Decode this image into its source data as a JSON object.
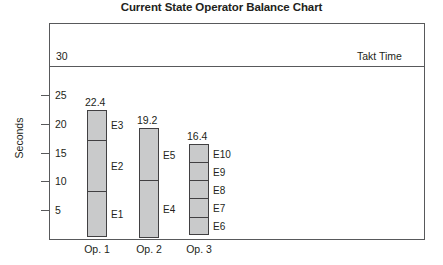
{
  "chart_data": {
    "type": "bar",
    "title": "Current State Operator Balance Chart",
    "xlabel": "",
    "ylabel": "Seconds",
    "ylim": [
      0,
      31
    ],
    "grid": false,
    "legend_position": "none",
    "categories": [
      "Op. 1",
      "Op. 2",
      "Op. 3"
    ],
    "values": [
      22.4,
      19.2,
      16.4
    ],
    "value_labels": [
      "22.4",
      "19.2",
      "16.4"
    ],
    "y_ticks": [
      5,
      10,
      15,
      20,
      25
    ],
    "y_tick_labels": [
      "5",
      "10",
      "15",
      "20",
      "25"
    ],
    "reference_line": {
      "label": "Takt Time",
      "value": 30,
      "value_label": "30"
    },
    "stacked_segments": [
      {
        "category": "Op. 1",
        "total": 22.4,
        "segments": [
          {
            "label": "E3",
            "value": 5.4
          },
          {
            "label": "E2",
            "value": 9.0
          },
          {
            "label": "E1",
            "value": 8.0
          }
        ]
      },
      {
        "category": "Op. 2",
        "total": 19.2,
        "segments": [
          {
            "label": "E5",
            "value": 9.2
          },
          {
            "label": "E4",
            "value": 10.0
          }
        ]
      },
      {
        "category": "Op. 3",
        "total": 16.4,
        "segments": [
          {
            "label": "E10",
            "value": 3.3
          },
          {
            "label": "E9",
            "value": 3.3
          },
          {
            "label": "E8",
            "value": 3.3
          },
          {
            "label": "E7",
            "value": 3.3
          },
          {
            "label": "E6",
            "value": 3.2
          }
        ]
      }
    ],
    "colors": {
      "segment_fill": "#c9cacb",
      "segment_stroke": "#414042",
      "axis": "#58595b",
      "text": "#231f20",
      "background": "#ffffff"
    }
  }
}
